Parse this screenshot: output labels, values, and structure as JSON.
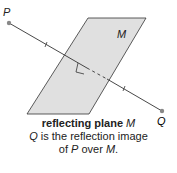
{
  "labels": {
    "point_p": "P",
    "point_q": "Q",
    "plane": "M"
  },
  "caption": {
    "title_prefix": "reflecting plane ",
    "title_var": "M",
    "line1_var": "Q",
    "line1_text": " is the reflection image",
    "line2_prefix": "of ",
    "line2_var1": "P",
    "line2_mid": " over ",
    "line2_var2": "M",
    "line2_end": "."
  },
  "colors": {
    "plane_fill": "#e0e0e0",
    "stroke": "#333333",
    "point": "#888888"
  }
}
